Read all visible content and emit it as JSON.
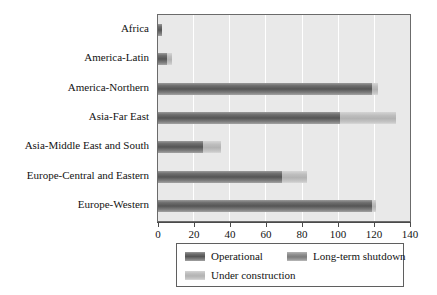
{
  "chart_data": {
    "type": "bar",
    "orientation": "horizontal",
    "stacked": true,
    "title": "",
    "xlabel": "",
    "ylabel": "",
    "xlim": [
      0,
      140
    ],
    "xticks": [
      0,
      20,
      40,
      60,
      80,
      100,
      120,
      140
    ],
    "grid": true,
    "grid_axis": "x",
    "legend_position": "bottom",
    "categories": [
      "Africa",
      "America-Latin",
      "America-Northern",
      "Asia-Far East",
      "Asia-Middle East and South",
      "Europe-Central and Eastern",
      "Europe-Western"
    ],
    "series": [
      {
        "name": "Operational",
        "color": "#6e6e6e",
        "values": [
          2,
          5,
          119,
          101,
          25,
          69,
          119
        ]
      },
      {
        "name": "Long-term shutdown",
        "color": "#8e8e8e",
        "values": [
          0,
          0,
          0,
          0,
          0,
          0,
          0
        ]
      },
      {
        "name": "Under construction",
        "color": "#c0c0c0",
        "values": [
          0,
          3,
          3,
          31,
          10,
          14,
          2
        ]
      }
    ]
  },
  "legend": {
    "items": [
      {
        "label": "Operational",
        "swatch": "operational-swatch"
      },
      {
        "label": "Long-term shutdown",
        "swatch": "long-term-shutdown-swatch"
      },
      {
        "label": "Under construction",
        "swatch": "under-construction-swatch"
      }
    ]
  },
  "axis": {
    "x_tick_labels": [
      "0",
      "20",
      "40",
      "60",
      "80",
      "100",
      "120",
      "140"
    ]
  }
}
